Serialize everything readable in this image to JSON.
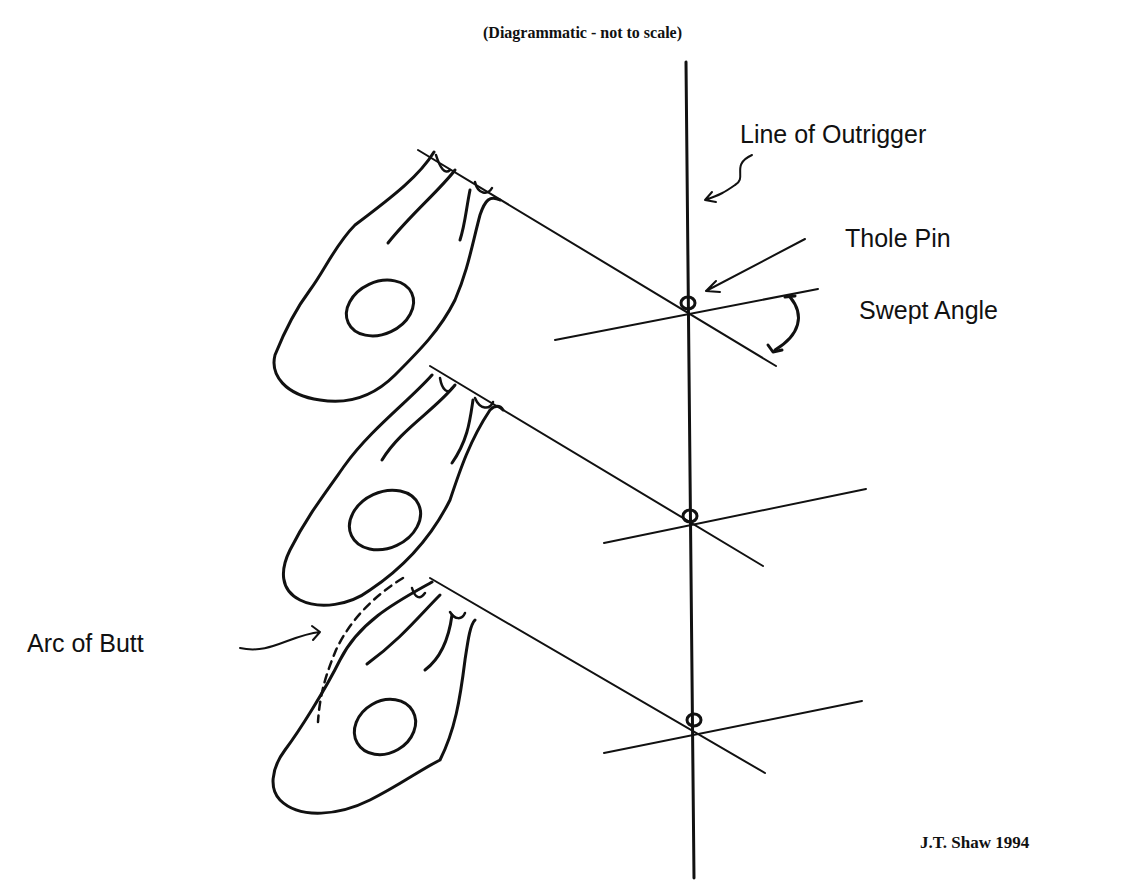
{
  "diagram": {
    "subtitle": "(Diagrammatic - not to scale)",
    "labels": {
      "outrigger": "Line of Outrigger",
      "thole_pin": "Thole Pin",
      "swept_angle": "Swept Angle",
      "arc_of_butt": "Arc of Butt"
    },
    "credit": "J.T. Shaw 1994",
    "positions": [
      {
        "name": "catch",
        "pin_y": 305
      },
      {
        "name": "middle",
        "pin_y": 516
      },
      {
        "name": "finish",
        "pin_y": 722
      }
    ],
    "colors": {
      "ink": "#111111",
      "background": "#ffffff"
    }
  }
}
